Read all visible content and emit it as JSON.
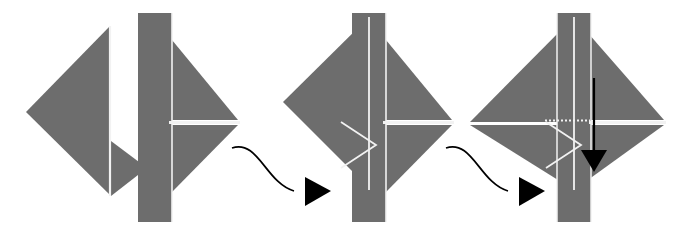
{
  "figure": {
    "title": "Paper folding sequence",
    "type": "origami-fold-diagram",
    "canvas": {
      "width": 679,
      "height": 235
    },
    "background_color": "#ffffff",
    "paper_color": "#6d6d6d",
    "crease_color": "#f2f2f2",
    "arrow_color": "#000000",
    "step_count": 4,
    "connector_count": 2
  },
  "steps": [
    {
      "index": 1,
      "name": "step-1-left-triangle-with-flap",
      "description": "Left-pointing triangle with a small folded flap at the lower right",
      "shapes": [
        {
          "name": "main-triangle",
          "type": "polygon",
          "points": "110,26 110,195 26,112",
          "fill": "#6d6d6d"
        },
        {
          "name": "lower-flap",
          "type": "polygon",
          "points": "111,140 111,196 147,168",
          "fill": "#6d6d6d"
        },
        {
          "name": "crease-line",
          "type": "line",
          "points": "110,26 110,196",
          "stroke": "#f2f2f2"
        }
      ]
    },
    {
      "index": 2,
      "name": "step-2-bar-and-right-triangle",
      "description": "Vertical strip with a right-pointing triangle split by a horizontal crease",
      "shapes": [
        {
          "name": "vertical-strip",
          "type": "rect",
          "x": 138,
          "y": 13,
          "width": 34,
          "height": 209,
          "fill": "#6d6d6d"
        },
        {
          "name": "upper-right-triangle",
          "type": "polygon",
          "points": "172,40 238,120 172,120",
          "fill": "#6d6d6d"
        },
        {
          "name": "lower-right-triangle",
          "type": "polygon",
          "points": "172,125 238,125 172,192",
          "fill": "#6d6d6d"
        },
        {
          "name": "horizontal-crease",
          "type": "line",
          "points": "168,122 240,122",
          "stroke": "#f2f2f2"
        }
      ]
    },
    {
      "index": 3,
      "name": "step-3-folded-left-over-strip",
      "description": "Left triangle folded over the strip with a small outlined triangular flap",
      "shapes": [
        {
          "name": "vertical-strip",
          "type": "rect",
          "x": 352,
          "y": 13,
          "width": 34,
          "height": 209,
          "fill": "#6d6d6d"
        },
        {
          "name": "left-folded-triangle",
          "type": "polygon",
          "points": "369,17 369,188 283,102",
          "fill": "#6d6d6d"
        },
        {
          "name": "upper-right-triangle",
          "type": "polygon",
          "points": "386,40 452,120 386,120",
          "fill": "#6d6d6d"
        },
        {
          "name": "lower-right-triangle",
          "type": "polygon",
          "points": "386,125 452,125 386,192",
          "fill": "#6d6d6d"
        },
        {
          "name": "horizontal-crease",
          "type": "line",
          "points": "382,122 454,122",
          "stroke": "#f2f2f2"
        },
        {
          "name": "small-flap-outline",
          "type": "polyline",
          "points": "341,122 375,145 341,168",
          "stroke": "#f2f2f2"
        },
        {
          "name": "fold-edge-line",
          "type": "line",
          "points": "369,17 369,190",
          "stroke": "#f2f2f2"
        }
      ]
    },
    {
      "index": 4,
      "name": "step-4-diamond-with-down-arrow",
      "description": "Diamond (square rotated 45 degrees) over the strip, with a black arrow pointing down and a dotted fold guide",
      "shapes": [
        {
          "name": "diamond-upper-left",
          "type": "polygon",
          "points": "574,17 574,122 470,122",
          "fill": "#6d6d6d"
        },
        {
          "name": "diamond-lower-left",
          "type": "polygon",
          "points": "574,125 574,190 470,125",
          "fill": "#6d6d6d"
        },
        {
          "name": "diamond-upper-right",
          "type": "polygon",
          "points": "574,17 664,120 574,120",
          "fill": "#6d6d6d"
        },
        {
          "name": "diamond-lower-right",
          "type": "polygon",
          "points": "574,125 664,125 574,190",
          "fill": "#6d6d6d"
        },
        {
          "name": "vertical-strip",
          "type": "rect",
          "x": 557,
          "y": 13,
          "width": 34,
          "height": 209,
          "fill": "#6d6d6d"
        },
        {
          "name": "horizontal-crease",
          "type": "line",
          "points": "589,122 666,122",
          "stroke": "#f2f2f2"
        },
        {
          "name": "dotted-fold-guide",
          "type": "line-dotted",
          "points": "545,120 589,120",
          "stroke": "#f2f2f2"
        },
        {
          "name": "small-flap-outline",
          "type": "polyline",
          "points": "546,122 580,145 546,168",
          "stroke": "#f2f2f2"
        },
        {
          "name": "fold-edge-line",
          "type": "line",
          "points": "574,17 574,190",
          "stroke": "#f2f2f2"
        },
        {
          "name": "down-arrow",
          "type": "arrow",
          "points": "594,78 594,150",
          "stroke": "#000000"
        }
      ]
    }
  ],
  "connectors": [
    {
      "index": 1,
      "name": "connector-arrow-1",
      "from_step": 2,
      "to_step": 3,
      "path": "M 232,148 C 258,140 266,182 292,190",
      "head": "307,178 307,205 332,191",
      "color": "#000000"
    },
    {
      "index": 2,
      "name": "connector-arrow-2",
      "from_step": 3,
      "to_step": 4,
      "path": "M 446,148 C 472,140 480,182 506,190",
      "head": "521,178 521,205 546,191",
      "color": "#000000"
    }
  ]
}
